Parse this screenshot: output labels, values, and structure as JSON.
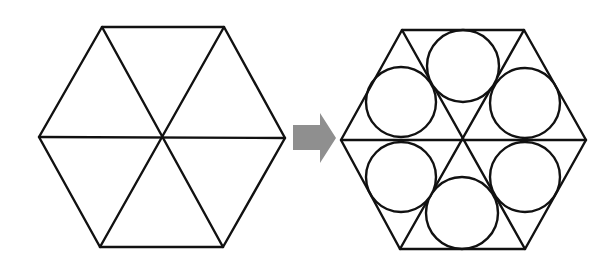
{
  "diagram": {
    "colors": {
      "line": "#111111",
      "arrow": "#8f8f8f",
      "background": "#ffffff"
    },
    "left_hexagon": {
      "center": [
        162,
        137
      ],
      "vertices": [
        [
          102,
          27
        ],
        [
          224,
          27
        ],
        [
          285,
          138
        ],
        [
          223,
          247
        ],
        [
          100,
          247
        ],
        [
          39,
          137
        ]
      ],
      "spokes": "three diagonals through center",
      "triangle_count": 6
    },
    "arrow": {
      "direction": "right",
      "shape": "block-arrow",
      "points": [
        [
          293,
          125
        ],
        [
          320,
          125
        ],
        [
          320,
          113
        ],
        [
          336,
          138
        ],
        [
          320,
          163
        ],
        [
          320,
          150
        ],
        [
          293,
          150
        ]
      ]
    },
    "right_hexagon": {
      "center": [
        463,
        140
      ],
      "vertices": [
        [
          402,
          30
        ],
        [
          524,
          30
        ],
        [
          586,
          140
        ],
        [
          525,
          249
        ],
        [
          400,
          249
        ],
        [
          341,
          140
        ]
      ],
      "spokes": "three diagonals through center",
      "triangle_count": 6,
      "inscribed_circles": [
        {
          "name": "top",
          "cx": 463,
          "cy": 66,
          "r": 36
        },
        {
          "name": "upper-right",
          "cx": 525,
          "cy": 103,
          "r": 35
        },
        {
          "name": "lower-right",
          "cx": 525,
          "cy": 177,
          "r": 35
        },
        {
          "name": "bottom",
          "cx": 462,
          "cy": 213,
          "r": 36
        },
        {
          "name": "lower-left",
          "cx": 401,
          "cy": 177,
          "r": 35
        },
        {
          "name": "upper-left",
          "cx": 401,
          "cy": 102,
          "r": 35
        }
      ]
    }
  }
}
